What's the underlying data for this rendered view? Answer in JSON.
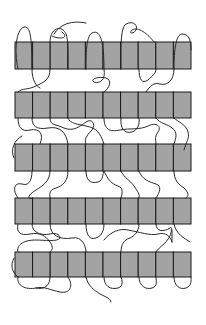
{
  "diagram": {
    "type": "schematic",
    "colors": {
      "background": "#ffffff",
      "band_fill": "#a3a3a3",
      "outline": "#1a1a1a",
      "chain": "#2a2a2a"
    },
    "band_layout": {
      "x_start": 15,
      "x_end": 191,
      "cells_per_band": 10
    },
    "bands": [
      {
        "id": "band-1",
        "top": 42,
        "bottom": 69
      },
      {
        "id": "band-2",
        "top": 92,
        "bottom": 118
      },
      {
        "id": "band-3",
        "top": 144,
        "bottom": 171
      },
      {
        "id": "band-4",
        "top": 198,
        "bottom": 224
      },
      {
        "id": "band-5",
        "top": 252,
        "bottom": 277
      }
    ],
    "chains": [
      "M18,69 C14,50 16,30 24,27 C30,26 32,35 32,69",
      "M32,42 L32,69 C32,80 36,86 40,88",
      "M50,42 C50,30 58,26 63,30 C68,34 68,40 68,69",
      "M50,69 C50,80 44,82 36,86 C28,90 22,88 18,92",
      "M54,34 C60,24 72,20 86,23",
      "M52,36 C60,40 70,38 62,32",
      "M86,69 C86,55 86,36 92,33 C98,30 104,34 104,69",
      "M104,69 C106,80 100,84 94,82 C90,80 96,76 106,78 C112,80 110,88 104,92",
      "M121,69 C121,50 120,28 126,24 C134,20 138,26 136,30 C134,34 128,34 132,30 C138,26 148,34 154,42",
      "M139,69 C139,80 142,84 148,80 C152,76 156,74 156,69",
      "M174,69 C174,50 176,34 182,34 C190,34 191,42 191,50",
      "M174,69 C174,80 168,86 160,84 C154,82 150,86 146,92",
      "M18,118 C18,128 22,132 30,130 C40,128 44,134 40,144",
      "M32,118 C32,126 36,130 48,128 C60,126 66,132 68,144",
      "M50,118 C50,126 56,124 64,128 C74,132 80,126 86,122 C92,118 96,124 92,130 C86,136 84,140 86,144",
      "M68,118 C70,124 78,124 86,126 C96,128 100,132 104,144",
      "M104,118 C104,130 110,132 120,130 C130,128 140,130 148,126 C156,122 162,126 158,132 C154,138 156,140 156,144",
      "M121,118 C120,128 124,134 132,132 C138,130 140,124 139,118",
      "M156,118 C160,124 168,124 172,128 C178,132 176,138 174,144",
      "M174,118 C178,122 186,124 188,132 C190,138 186,142 184,150",
      "M14,158 C10,150 14,140 22,136",
      "M32,171 C32,182 28,186 22,184 C14,182 12,190 18,198",
      "M50,171 C50,182 42,186 36,190 C26,196 28,200 32,198",
      "M68,171 C68,182 62,186 56,188 C48,190 50,196 50,198",
      "M86,171 C86,180 90,184 98,182 C104,180 102,174 104,171",
      "M104,171 C108,180 112,184 118,186 C124,188 122,194 121,198",
      "M121,171 C124,178 130,180 134,186 C138,192 140,194 139,198",
      "M139,171 C142,180 150,182 156,184 C162,186 160,192 156,198",
      "M174,171 C174,180 178,184 184,188 C190,194 188,196 186,198",
      "M18,224 C16,232 20,236 30,234 C40,232 46,236 50,242 C54,248 52,250 50,252",
      "M32,224 C32,232 40,236 50,234 C58,232 60,236 60,238 C58,242 44,240 36,240 C22,240 16,246 18,252",
      "M50,224 C50,236 60,240 72,238 C82,236 86,246 86,252",
      "M86,224 C86,236 90,240 96,238 C102,236 104,230 104,224",
      "M104,240 C110,232 120,228 128,230 C140,232 150,236 158,234 C166,232 170,236 172,242",
      "M139,224 C139,232 134,236 130,238 C124,240 121,244 121,252",
      "M156,224 C156,232 164,232 170,228 C172,226 172,230 170,236 C166,244 160,246 156,252",
      "M172,230 L172,242",
      "M174,224 C176,234 184,238 190,242",
      "M18,277 C16,286 26,290 36,288 C44,286 50,290 60,292 C70,294 74,286 68,277",
      "M50,277 C50,286 44,290 36,288",
      "M86,277 C88,286 94,290 100,294 C108,298 110,298 111,302",
      "M104,277 C104,286 110,290 118,288 C124,286 122,280 121,277",
      "M139,277 C139,286 146,290 152,288 C158,286 156,282 156,277",
      "M174,277 C174,286 180,290 186,288 C192,286 191,280 191,277",
      "M14,258 C10,266 12,272 18,277"
    ]
  }
}
